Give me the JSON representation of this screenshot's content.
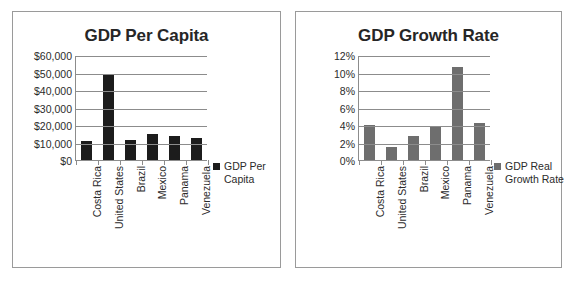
{
  "charts": [
    {
      "title": "GDP Per Capita",
      "legend_label": "GDP Per Capita",
      "legend_color": "#1c1c1c",
      "yticks": [
        "$0",
        "$10,000",
        "$20,000",
        "$30,000",
        "$40,000",
        "$50,000",
        "$60,000"
      ],
      "categories": [
        "Costa Rica",
        "United States",
        "Brazil",
        "Mexico",
        "Panama",
        "Venezuela"
      ]
    },
    {
      "title": "GDP Growth Rate",
      "legend_label": "GDP Real Growth Rate",
      "legend_color": "#6e6e6e",
      "yticks": [
        "0%",
        "2%",
        "4%",
        "6%",
        "8%",
        "10%",
        "12%"
      ],
      "categories": [
        "Costa Rica",
        "United States",
        "Brazil",
        "Mexico",
        "Panama",
        "Venezuela"
      ]
    }
  ],
  "chart_data": [
    {
      "type": "bar",
      "title": "GDP Per Capita",
      "xlabel": "",
      "ylabel": "",
      "categories": [
        "Costa Rica",
        "United States",
        "Brazil",
        "Mexico",
        "Panama",
        "Venezuela"
      ],
      "values": [
        11000,
        48400,
        11300,
        15100,
        13600,
        12700
      ],
      "series": [
        {
          "name": "GDP Per Capita",
          "color": "#1c1c1c",
          "values": [
            11000,
            48400,
            11300,
            15100,
            13600,
            12700
          ]
        }
      ],
      "ylim": [
        0,
        60000
      ],
      "ytick_values": [
        0,
        10000,
        20000,
        30000,
        40000,
        50000,
        60000
      ],
      "ytick_labels": [
        "$0",
        "$10,000",
        "$20,000",
        "$30,000",
        "$40,000",
        "$50,000",
        "$60,000"
      ],
      "grid": true,
      "legend_position": "right",
      "legend_entries": [
        "GDP Per Capita"
      ]
    },
    {
      "type": "bar",
      "title": "GDP Growth Rate",
      "xlabel": "",
      "ylabel": "",
      "categories": [
        "Costa Rica",
        "United States",
        "Brazil",
        "Mexico",
        "Panama",
        "Venezuela"
      ],
      "values": [
        4.0,
        1.5,
        2.7,
        3.8,
        10.6,
        4.2
      ],
      "series": [
        {
          "name": "GDP Real Growth Rate",
          "color": "#6e6e6e",
          "values": [
            4.0,
            1.5,
            2.7,
            3.8,
            10.6,
            4.2
          ]
        }
      ],
      "ylim": [
        0,
        12
      ],
      "ytick_values": [
        0,
        2,
        4,
        6,
        8,
        10,
        12
      ],
      "ytick_labels": [
        "0%",
        "2%",
        "4%",
        "6%",
        "8%",
        "10%",
        "12%"
      ],
      "grid": true,
      "legend_position": "right",
      "legend_entries": [
        "GDP Real Growth Rate"
      ]
    }
  ]
}
